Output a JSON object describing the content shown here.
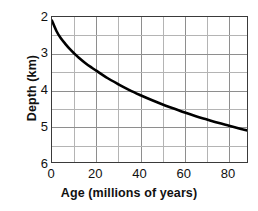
{
  "chart_data": {
    "type": "line",
    "title": "",
    "xlabel": "Age (millions of years)",
    "ylabel": "Depth (km)",
    "xlim": [
      0,
      89
    ],
    "ylim": [
      2,
      6
    ],
    "y_inverted": true,
    "grid": true,
    "legend": false,
    "x_ticks": [
      0,
      20,
      40,
      60,
      80
    ],
    "x_tick_labels": [
      "0",
      "20",
      "40",
      "60",
      "80"
    ],
    "y_ticks": [
      2,
      3,
      4,
      5,
      6
    ],
    "y_tick_labels": [
      "2",
      "3",
      "4",
      "5",
      "6"
    ],
    "x_minor_step": 10,
    "y_minor_step": 0.5,
    "series": [
      {
        "name": "Ocean floor depth vs age",
        "color": "#000000",
        "x": [
          0,
          2,
          4,
          6,
          8,
          10,
          12,
          15,
          18,
          20,
          25,
          30,
          35,
          40,
          45,
          50,
          55,
          60,
          65,
          70,
          75,
          80,
          85,
          89
        ],
        "y": [
          2.1,
          2.38,
          2.58,
          2.73,
          2.87,
          2.99,
          3.1,
          3.25,
          3.38,
          3.46,
          3.66,
          3.83,
          3.99,
          4.13,
          4.26,
          4.38,
          4.49,
          4.6,
          4.7,
          4.79,
          4.88,
          4.96,
          5.04,
          5.1
        ]
      }
    ],
    "curve_note": "depth increases with square root of age; depth axis inverted"
  },
  "axes": {
    "x_title": "Age (millions of years)",
    "y_title": "Depth (km)",
    "x_tick_labels": [
      "0",
      "20",
      "40",
      "60",
      "80"
    ],
    "y_tick_labels": [
      "2",
      "3",
      "4",
      "5",
      "6"
    ]
  },
  "colors": {
    "curve": "#000000",
    "frame": "#3a3a3a",
    "grid_major": "#8e8e8e",
    "grid_minor": "#b4b4b4",
    "text": "#111111",
    "background": "#ffffff"
  }
}
